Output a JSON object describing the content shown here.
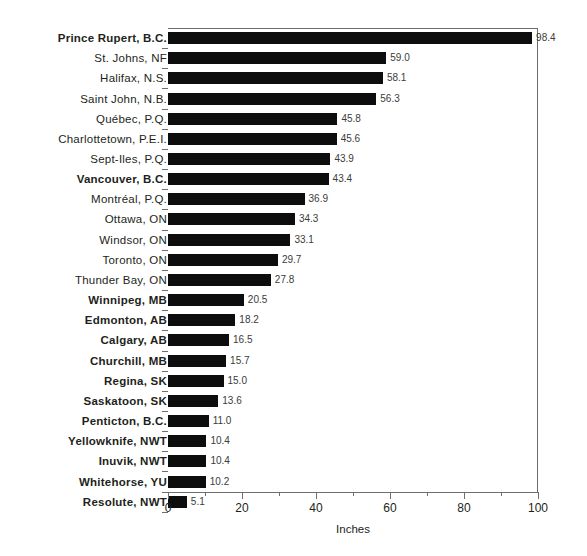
{
  "chart_data": {
    "type": "bar",
    "orientation": "horizontal",
    "title": "",
    "xlabel": "Inches",
    "ylabel": "",
    "xlim": [
      0,
      100
    ],
    "xticks": [
      0,
      20,
      40,
      60,
      80,
      100
    ],
    "xtick_labels": [
      "0",
      "20",
      "40",
      "60",
      "80",
      "100"
    ],
    "minor_xticks": [
      10,
      30,
      50,
      70,
      90
    ],
    "grid": false,
    "legend": null,
    "bar_color": "#0d0d0d",
    "axis_color": "#6d6e71",
    "value_label_color": "#3b3b3b",
    "categories": [
      "Prince Rupert, B.C.",
      "St. Johns, NF",
      "Halifax, N.S.",
      "Saint John, N.B.",
      "Québec, P.Q.",
      "Charlottetown, P.E.I.",
      "Sept-Iles, P.Q.",
      "Vancouver, B.C.",
      "Montréal, P.Q.",
      "Ottawa, ON",
      "Windsor, ON",
      "Toronto, ON",
      "Thunder Bay, ON",
      "Winnipeg, MB",
      "Edmonton, AB",
      "Calgary, AB",
      "Churchill, MB",
      "Regina, SK",
      "Saskatoon, SK",
      "Penticton, B.C.",
      "Yellowknife, NWT",
      "Inuvik, NWT",
      "Whitehorse, YU",
      "Resolute, NWT"
    ],
    "values": [
      98.4,
      59.0,
      58.1,
      56.3,
      45.8,
      45.6,
      43.9,
      43.4,
      36.9,
      34.3,
      33.1,
      29.7,
      27.8,
      20.5,
      18.2,
      16.5,
      15.7,
      15.0,
      13.6,
      11.0,
      10.4,
      10.4,
      10.2,
      5.1
    ],
    "value_labels": [
      "98.4",
      "59.0",
      "58.1",
      "56.3",
      "45.8",
      "45.6",
      "43.9",
      "43.4",
      "36.9",
      "34.3",
      "33.1",
      "29.7",
      "27.8",
      "20.5",
      "18.2",
      "16.5",
      "15.7",
      "15.0",
      "13.6",
      "11.0",
      "10.4",
      "10.4",
      "10.2",
      "5.1"
    ],
    "bold_categories": [
      "Prince Rupert, B.C.",
      "Vancouver, B.C.",
      "Winnipeg, MB",
      "Edmonton, AB",
      "Calgary, AB",
      "Churchill, MB",
      "Regina, SK",
      "Saskatoon, SK",
      "Penticton, B.C.",
      "Yellowknife, NWT",
      "Inuvik, NWT",
      "Whitehorse, YU",
      "Resolute, NWT"
    ]
  }
}
